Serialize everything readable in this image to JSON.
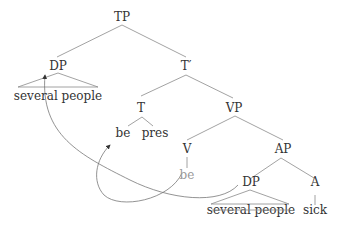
{
  "diagram": {
    "type": "syntax-tree",
    "nodes": {
      "tp": "TP",
      "dp_top": "DP",
      "dp_top_yield": "several people",
      "t_bar": "T′",
      "t": "T",
      "t_be": "be",
      "t_pres": "pres",
      "vp": "VP",
      "v": "V",
      "v_be": "be",
      "ap": "AP",
      "dp_low": "DP",
      "dp_low_yield": "several people",
      "a": "A",
      "a_sick": "sick"
    },
    "movements": [
      {
        "from": "v_be",
        "to": "t_be",
        "label": "head movement"
      },
      {
        "from": "dp_low",
        "to": "dp_top",
        "label": "DP movement"
      }
    ],
    "colors": {
      "text": "#333333",
      "trace_text": "#9a9a9a",
      "lines": "#8a8a8a"
    }
  }
}
